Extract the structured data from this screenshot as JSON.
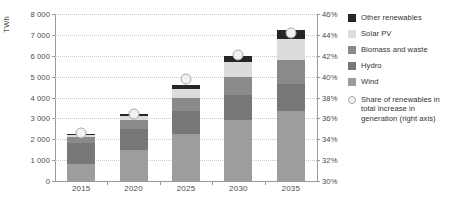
{
  "chart_data": {
    "type": "bar",
    "title": "",
    "xlabel": "",
    "ylabel": "TWh",
    "categories": [
      "2015",
      "2020",
      "2025",
      "2030",
      "2035"
    ],
    "ylim": [
      0,
      8000
    ],
    "ytick_labels": [
      "0",
      "1 000",
      "2 000",
      "3 000",
      "4 000",
      "5 000",
      "6 000",
      "7 000",
      "8 000"
    ],
    "ytick_values": [
      0,
      1000,
      2000,
      3000,
      4000,
      5000,
      6000,
      7000,
      8000
    ],
    "y2lim": [
      30,
      46
    ],
    "y2tick_labels": [
      "30%",
      "32%",
      "34%",
      "36%",
      "38%",
      "40%",
      "42%",
      "44%",
      "46%"
    ],
    "y2tick_values": [
      30,
      32,
      34,
      36,
      38,
      40,
      42,
      44,
      46
    ],
    "grid": true,
    "legend_position": "right",
    "stacked": true,
    "series": [
      {
        "name": "Wind",
        "color": "#9d9d9d",
        "values": [
          820,
          1500,
          2250,
          2900,
          3350
        ]
      },
      {
        "name": "Hydro",
        "color": "#777777",
        "values": [
          1000,
          1000,
          1080,
          1200,
          1320
        ]
      },
      {
        "name": "Biomass and waste",
        "color": "#8a8a8a",
        "values": [
          280,
          420,
          640,
          900,
          1150
        ]
      },
      {
        "name": "Solar PV",
        "color": "#dcdcdc",
        "values": [
          100,
          200,
          420,
          680,
          1000
        ]
      },
      {
        "name": "Other renewables",
        "color": "#262626",
        "values": [
          50,
          110,
          190,
          320,
          430
        ]
      }
    ],
    "overlay": {
      "name": "Share of renewables in total increase in generation (right axis)",
      "axis": "right",
      "marker": "circle",
      "values": [
        34.6,
        36.4,
        39.8,
        42.1,
        44.2
      ]
    }
  },
  "legend": {
    "items": [
      {
        "label": "Other renewables",
        "color": "#262626"
      },
      {
        "label": "Solar PV",
        "color": "#dcdcdc"
      },
      {
        "label": "Biomass and waste",
        "color": "#8a8a8a"
      },
      {
        "label": "Hydro",
        "color": "#777777"
      },
      {
        "label": "Wind",
        "color": "#9d9d9d"
      }
    ],
    "note": "Share of renewables in total increase in generation (right axis)"
  }
}
